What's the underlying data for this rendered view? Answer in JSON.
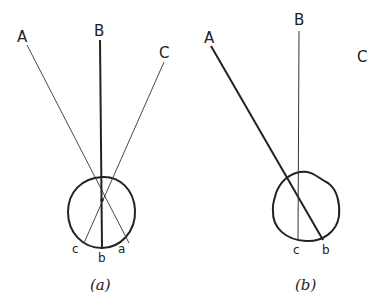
{
  "figure": {
    "panels": [
      {
        "caption": "(a)",
        "ray_labels": {
          "A": "A",
          "B": "B",
          "C": "C"
        },
        "retina_labels": {
          "c": "c",
          "b": "b",
          "a": "a"
        }
      },
      {
        "caption": "(b)",
        "ray_labels": {
          "A": "A",
          "B": "B",
          "C": "C"
        },
        "retina_labels": {
          "c": "c",
          "b": "b"
        }
      }
    ]
  }
}
